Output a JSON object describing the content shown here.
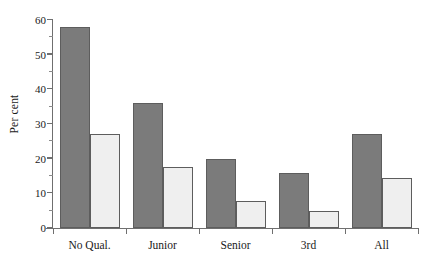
{
  "chart_data": {
    "type": "bar",
    "title": "",
    "xlabel": "",
    "ylabel": "Per cent",
    "ylim": [
      0,
      60
    ],
    "ytick_values": [
      0,
      10,
      20,
      30,
      40,
      50,
      60
    ],
    "ytick_labels": [
      "0",
      "10",
      "20",
      "30",
      "40",
      "50",
      "60"
    ],
    "yminor_values": [
      5,
      15,
      25,
      35,
      45,
      55
    ],
    "grid": false,
    "legend": "none",
    "categories": [
      "No Qual.",
      "Junior",
      "Senior",
      "3rd",
      "All"
    ],
    "series": [
      {
        "name": "dark",
        "color": "#7b7b7b",
        "edge_color": "#5d5d5d",
        "values": [
          58,
          36,
          20,
          16,
          27
        ]
      },
      {
        "name": "light",
        "color": "#efefef",
        "edge_color": "#5d5d5d",
        "values": [
          27,
          17.5,
          7.8,
          5,
          14.3
        ]
      }
    ]
  },
  "axis": {
    "ylabel_text": "Per cent",
    "axis_color": "#6f6f6f"
  }
}
